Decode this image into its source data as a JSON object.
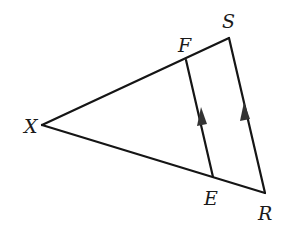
{
  "diagram": {
    "type": "triangle-with-parallel-segment",
    "colors": {
      "stroke": "#151515",
      "label": "#1a1a1a",
      "arrow": "#333333",
      "background": "#ffffff"
    },
    "points": {
      "X": {
        "label": "X",
        "x": 42,
        "y": 125,
        "label_x": 24,
        "label_y": 133
      },
      "F": {
        "label": "F",
        "x": 186,
        "y": 60,
        "label_x": 178,
        "label_y": 52
      },
      "S": {
        "label": "S",
        "x": 229,
        "y": 38,
        "label_x": 222,
        "label_y": 28
      },
      "E": {
        "label": "E",
        "x": 213,
        "y": 177,
        "label_x": 204,
        "label_y": 205
      },
      "R": {
        "label": "R",
        "x": 265,
        "y": 193,
        "label_x": 258,
        "label_y": 220
      }
    },
    "segments": [
      {
        "from": "X",
        "to": "S"
      },
      {
        "from": "X",
        "to": "R"
      },
      {
        "from": "S",
        "to": "R"
      },
      {
        "from": "F",
        "to": "E"
      }
    ],
    "parallel_markers": [
      {
        "segment": "FE",
        "count": 1,
        "direction": "up"
      },
      {
        "segment": "SR",
        "count": 1,
        "direction": "up"
      }
    ],
    "labels": [
      "X",
      "F",
      "S",
      "E",
      "R"
    ]
  }
}
